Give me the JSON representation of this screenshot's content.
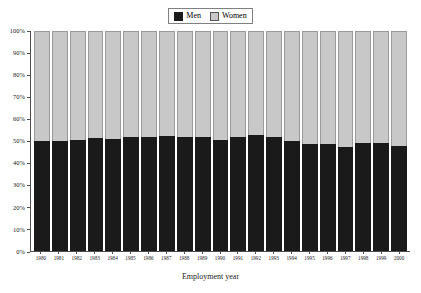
{
  "chart_data": {
    "type": "bar",
    "subtype": "stacked-100-percent",
    "title": "",
    "xlabel": "Employment year",
    "ylabel": "",
    "ylim": [
      0,
      100
    ],
    "yticks": [
      "0%",
      "10%",
      "20%",
      "30%",
      "40%",
      "50%",
      "60%",
      "70%",
      "80%",
      "90%",
      "100%"
    ],
    "ytick_values": [
      0,
      10,
      20,
      30,
      40,
      50,
      60,
      70,
      80,
      90,
      100
    ],
    "grid": false,
    "legend_position": "top-center",
    "categories": [
      "1980",
      "1981",
      "1982",
      "1983",
      "1984",
      "1985",
      "1986",
      "1987",
      "1988",
      "1989",
      "1990",
      "1991",
      "1992",
      "1993",
      "1994",
      "1995",
      "1996",
      "1997",
      "1998",
      "1999",
      "2000"
    ],
    "series": [
      {
        "name": "Men",
        "color": "#1a1a1a",
        "values": [
          50.0,
          50.0,
          50.6,
          51.2,
          51.0,
          51.8,
          51.9,
          52.2,
          51.6,
          51.8,
          50.6,
          51.8,
          52.8,
          51.6,
          50.2,
          48.6,
          48.8,
          47.4,
          49.2,
          49.0,
          47.8
        ]
      },
      {
        "name": "Women",
        "color": "#c8c8c8",
        "values": [
          50.0,
          50.0,
          49.4,
          48.8,
          49.0,
          48.2,
          48.1,
          47.8,
          48.4,
          48.2,
          49.4,
          48.2,
          47.2,
          48.4,
          49.8,
          51.4,
          51.2,
          52.6,
          50.8,
          51.0,
          52.2
        ]
      }
    ]
  },
  "legend": {
    "entries": [
      {
        "label": "Men",
        "swatch": "men"
      },
      {
        "label": "Women",
        "swatch": "women"
      }
    ]
  },
  "axis": {
    "x_title": "Employment year"
  }
}
